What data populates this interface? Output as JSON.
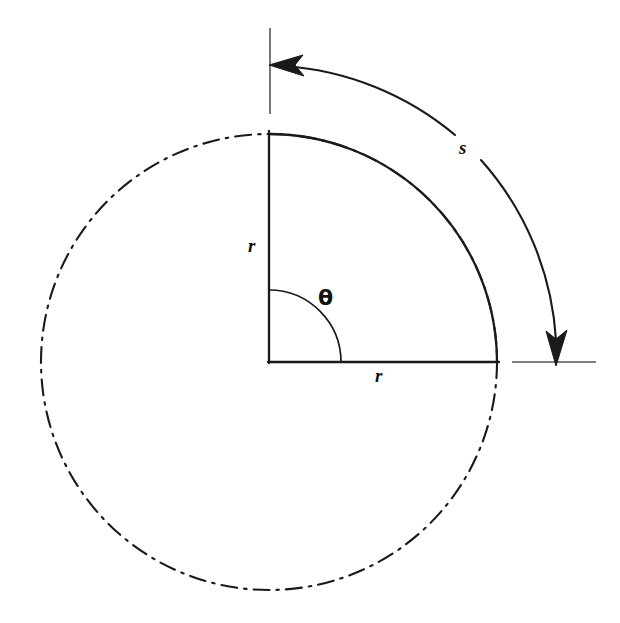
{
  "figure": {
    "background_color": "#ffffff",
    "stroke_color": "#1a1a1a",
    "labels": {
      "radius_vertical": "r",
      "radius_horizontal": "r",
      "angle": "θ",
      "arc_length": "s"
    },
    "geometry": {
      "center_x": 269,
      "center_y": 362,
      "radius": 228,
      "angle_arc_radius": 72,
      "outer_arc_radius": 297,
      "sector_start_angle_deg": 90,
      "sector_end_angle_deg": 0
    },
    "elements": [
      {
        "name": "dash-dot-circle",
        "style": "dash-dot"
      },
      {
        "name": "quarter-arc",
        "style": "solid"
      },
      {
        "name": "vertical-radius",
        "style": "solid"
      },
      {
        "name": "horizontal-radius",
        "style": "solid"
      },
      {
        "name": "angle-arc",
        "style": "solid"
      },
      {
        "name": "outer-double-arrow-arc",
        "style": "solid"
      },
      {
        "name": "top-tick-line",
        "style": "solid"
      },
      {
        "name": "right-tick-line",
        "style": "solid"
      }
    ]
  }
}
